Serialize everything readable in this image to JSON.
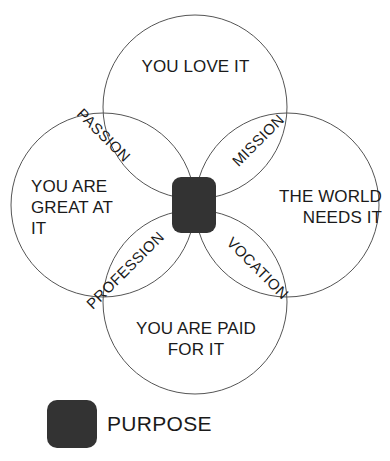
{
  "diagram": {
    "type": "venn",
    "title": "",
    "circles": [
      {
        "id": "love",
        "label": "YOU LOVE IT",
        "position": "top",
        "cx": 195,
        "cy": 107,
        "r": 92
      },
      {
        "id": "great",
        "label": "YOU ARE\nGREAT AT\nIT",
        "position": "left",
        "cx": 103,
        "cy": 205,
        "r": 92
      },
      {
        "id": "world",
        "label": "THE WORLD\nNEEDS IT",
        "position": "right",
        "cx": 287,
        "cy": 205,
        "r": 92
      },
      {
        "id": "paid",
        "label": "YOU ARE PAID\nFOR IT",
        "position": "bottom",
        "cx": 195,
        "cy": 302,
        "r": 92
      }
    ],
    "overlaps": [
      {
        "id": "passion",
        "label": "PASSION",
        "between": [
          "love",
          "great"
        ],
        "rotation": 45
      },
      {
        "id": "mission",
        "label": "MISSION",
        "between": [
          "love",
          "world"
        ],
        "rotation": -45
      },
      {
        "id": "profession",
        "label": "PROFESSION",
        "between": [
          "great",
          "paid"
        ],
        "rotation": -45
      },
      {
        "id": "vocation",
        "label": "VOCATION",
        "between": [
          "world",
          "paid"
        ],
        "rotation": 45
      }
    ],
    "center": {
      "id": "purpose",
      "label": "PURPOSE",
      "fill": "#333333",
      "shape": "rounded-square"
    },
    "stroke_color": "#555555",
    "background": "#ffffff"
  },
  "legend": {
    "swatch_color": "#333333",
    "label": "PURPOSE"
  }
}
